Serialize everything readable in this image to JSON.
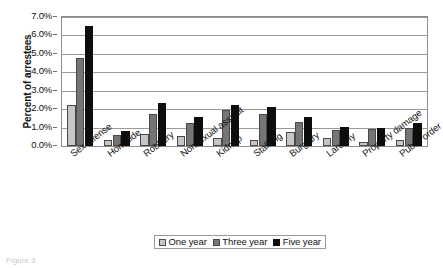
{
  "chart_data": {
    "type": "bar",
    "title": "",
    "xlabel": "",
    "ylabel": "Percent of arrestees",
    "ylim": [
      0,
      7
    ],
    "ytick_labels": [
      "0.0%",
      "1.0%",
      "2.0%",
      "3.0%",
      "4.0%",
      "5.0%",
      "6.0%",
      "7.0%"
    ],
    "ytick_values": [
      0,
      1,
      2,
      3,
      4,
      5,
      6,
      7
    ],
    "grid": true,
    "legend_position": "bottom",
    "categories": [
      "Sex offense",
      "Homicide",
      "Robbery",
      "Nonsexual assault",
      "Kidnap",
      "Stalking",
      "Burglary",
      "Larceny",
      "Property damage",
      "Public order"
    ],
    "series": [
      {
        "name": "One year",
        "color": "#c6c6c6",
        "values": [
          2.2,
          0.3,
          0.65,
          0.55,
          0.45,
          0.35,
          0.75,
          0.45,
          0.2,
          0.3
        ]
      },
      {
        "name": "Three year",
        "color": "#757575",
        "values": [
          4.8,
          0.6,
          1.75,
          1.25,
          1.95,
          1.75,
          1.3,
          0.85,
          0.95,
          1.0
        ]
      },
      {
        "name": "Five year",
        "color": "#0d0d0d",
        "values": [
          6.5,
          0.8,
          2.35,
          1.6,
          2.25,
          2.1,
          1.6,
          1.05,
          1.0,
          1.25
        ]
      }
    ]
  },
  "footnote": "Figure 3"
}
